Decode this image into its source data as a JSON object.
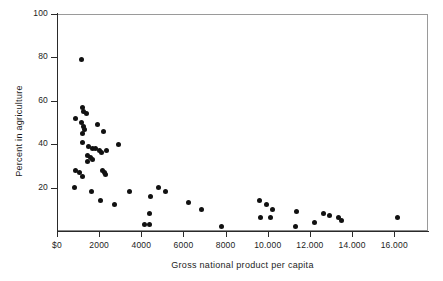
{
  "chart_data": {
    "type": "scatter",
    "title": "",
    "xlabel": "Gross national product per capita",
    "ylabel": "Percent in agriculture",
    "xlim": [
      0,
      17600
    ],
    "ylim": [
      0,
      100
    ],
    "grid": false,
    "legend": null,
    "marker": {
      "shape": "circle",
      "color": "#111111",
      "size_px": 5
    },
    "xticks": [
      0,
      2000,
      4000,
      6000,
      8000,
      10000,
      12000,
      14000,
      16000
    ],
    "xticklabels": [
      "$0",
      "2000",
      "4000",
      "6000",
      "8000",
      "10.000",
      "12.000",
      "14.000",
      "16.000"
    ],
    "yticks": [
      20,
      40,
      60,
      80,
      100
    ],
    "yticklabels": [
      "20",
      "40",
      "60",
      "80",
      "100"
    ],
    "points": [
      {
        "x": 1150,
        "y": 79
      },
      {
        "x": 900,
        "y": 52
      },
      {
        "x": 1200,
        "y": 57
      },
      {
        "x": 1250,
        "y": 55
      },
      {
        "x": 1400,
        "y": 54
      },
      {
        "x": 1150,
        "y": 50
      },
      {
        "x": 1250,
        "y": 48
      },
      {
        "x": 1300,
        "y": 47
      },
      {
        "x": 1900,
        "y": 49
      },
      {
        "x": 1200,
        "y": 45
      },
      {
        "x": 2200,
        "y": 46
      },
      {
        "x": 1200,
        "y": 41
      },
      {
        "x": 1500,
        "y": 39
      },
      {
        "x": 1700,
        "y": 38
      },
      {
        "x": 1850,
        "y": 38
      },
      {
        "x": 2000,
        "y": 37
      },
      {
        "x": 2100,
        "y": 36
      },
      {
        "x": 2350,
        "y": 37
      },
      {
        "x": 2900,
        "y": 40
      },
      {
        "x": 1450,
        "y": 35
      },
      {
        "x": 1600,
        "y": 34
      },
      {
        "x": 1700,
        "y": 33
      },
      {
        "x": 1450,
        "y": 32
      },
      {
        "x": 900,
        "y": 28
      },
      {
        "x": 1050,
        "y": 27
      },
      {
        "x": 1200,
        "y": 25
      },
      {
        "x": 2150,
        "y": 28
      },
      {
        "x": 2250,
        "y": 27
      },
      {
        "x": 2300,
        "y": 26
      },
      {
        "x": 850,
        "y": 20
      },
      {
        "x": 1650,
        "y": 18
      },
      {
        "x": 3450,
        "y": 18
      },
      {
        "x": 4450,
        "y": 16
      },
      {
        "x": 4800,
        "y": 20
      },
      {
        "x": 5150,
        "y": 18
      },
      {
        "x": 2050,
        "y": 14
      },
      {
        "x": 2750,
        "y": 12
      },
      {
        "x": 6250,
        "y": 13
      },
      {
        "x": 6850,
        "y": 10
      },
      {
        "x": 4400,
        "y": 8
      },
      {
        "x": 4150,
        "y": 3
      },
      {
        "x": 4400,
        "y": 3
      },
      {
        "x": 7800,
        "y": 2
      },
      {
        "x": 9600,
        "y": 14
      },
      {
        "x": 9950,
        "y": 12
      },
      {
        "x": 10200,
        "y": 10
      },
      {
        "x": 9650,
        "y": 6
      },
      {
        "x": 10150,
        "y": 6
      },
      {
        "x": 11350,
        "y": 9
      },
      {
        "x": 11300,
        "y": 2
      },
      {
        "x": 12200,
        "y": 4
      },
      {
        "x": 12650,
        "y": 8
      },
      {
        "x": 12950,
        "y": 7
      },
      {
        "x": 13350,
        "y": 6
      },
      {
        "x": 13500,
        "y": 5
      },
      {
        "x": 16150,
        "y": 6
      }
    ]
  }
}
